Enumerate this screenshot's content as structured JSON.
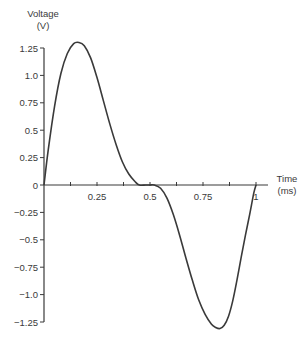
{
  "chart_data": {
    "type": "line",
    "title": "",
    "xlabel": "Time (ms)",
    "ylabel": "Voltage (V)",
    "xlabel_lines": [
      "Time",
      "(ms)"
    ],
    "ylabel_lines": [
      "Voltage",
      "(V)"
    ],
    "xlim": [
      0,
      1.05
    ],
    "ylim": [
      -1.25,
      1.25
    ],
    "grid": false,
    "legend": null,
    "x_ticks": [
      0.125,
      0.25,
      0.375,
      0.5,
      0.625,
      0.75,
      0.875,
      1
    ],
    "x_tick_labels": [
      {
        "value": 0.25,
        "label": "0.25"
      },
      {
        "value": 0.5,
        "label": "0.5"
      },
      {
        "value": 0.75,
        "label": "0.75"
      },
      {
        "value": 1,
        "label": "1"
      }
    ],
    "y_ticks": [
      {
        "value": 1.25,
        "label": "1.25"
      },
      {
        "value": 1.0,
        "label": "1.0"
      },
      {
        "value": 0.75,
        "label": "0.75"
      },
      {
        "value": 0.5,
        "label": "0.5"
      },
      {
        "value": 0.25,
        "label": "0.25"
      },
      {
        "value": 0,
        "label": "0"
      },
      {
        "value": -0.25,
        "label": "−0.25"
      },
      {
        "value": -0.5,
        "label": "−0.5"
      },
      {
        "value": -0.75,
        "label": "−0.75"
      },
      {
        "value": -1.0,
        "label": "−1.0"
      },
      {
        "value": -1.25,
        "label": "−1.25"
      }
    ],
    "series": [
      {
        "name": "Voltage",
        "color": "#3a3a3a",
        "x": [
          0,
          0.02,
          0.05,
          0.08,
          0.11,
          0.14,
          0.165,
          0.19,
          0.22,
          0.25,
          0.28,
          0.31,
          0.34,
          0.37,
          0.4,
          0.43,
          0.45,
          0.48,
          0.5,
          0.52,
          0.55,
          0.58,
          0.61,
          0.64,
          0.67,
          0.7,
          0.73,
          0.76,
          0.79,
          0.81,
          0.83,
          0.85,
          0.87,
          0.89,
          0.91,
          0.93,
          0.95,
          0.97,
          0.99,
          1.0
        ],
        "y": [
          0,
          0.32,
          0.72,
          1.02,
          1.2,
          1.29,
          1.3,
          1.27,
          1.16,
          0.98,
          0.77,
          0.56,
          0.37,
          0.21,
          0.1,
          0.03,
          0.0,
          0.0,
          0.0,
          0.0,
          -0.03,
          -0.12,
          -0.27,
          -0.46,
          -0.67,
          -0.87,
          -1.05,
          -1.18,
          -1.27,
          -1.3,
          -1.31,
          -1.28,
          -1.2,
          -1.06,
          -0.87,
          -0.66,
          -0.46,
          -0.27,
          -0.07,
          0.0
        ]
      }
    ]
  }
}
